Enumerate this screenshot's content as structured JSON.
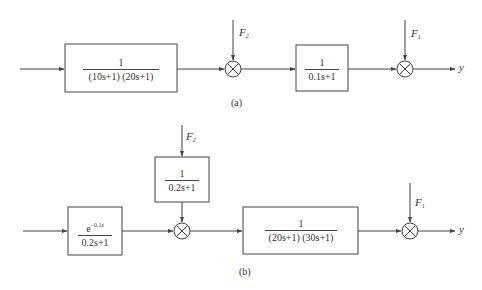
{
  "diagram_a": {
    "caption": "(a)",
    "blocks": [
      {
        "id": "G1",
        "numerator": "1",
        "denominator": "(10s+1) (20s+1)"
      },
      {
        "id": "G2",
        "numerator": "1",
        "denominator": "0.1s+1"
      }
    ],
    "disturbances": [
      {
        "name": "F",
        "sub": "2"
      },
      {
        "name": "F",
        "sub": "1"
      }
    ],
    "output": "y"
  },
  "diagram_b": {
    "caption": "(b)",
    "blocks": [
      {
        "id": "Gd",
        "numerator_base": "e",
        "numerator_exp": "−0.1s",
        "denominator": "0.2s+1"
      },
      {
        "id": "GF2",
        "numerator": "1",
        "denominator": "0.2s+1"
      },
      {
        "id": "Gp",
        "numerator": "1",
        "denominator": "(20s+1) (30s+1)"
      }
    ],
    "disturbances": [
      {
        "name": "F",
        "sub": "2"
      },
      {
        "name": "F",
        "sub": "1"
      }
    ],
    "output": "y"
  },
  "colors": {
    "line": "#444444",
    "text": "#333333",
    "background": "#ffffff"
  }
}
